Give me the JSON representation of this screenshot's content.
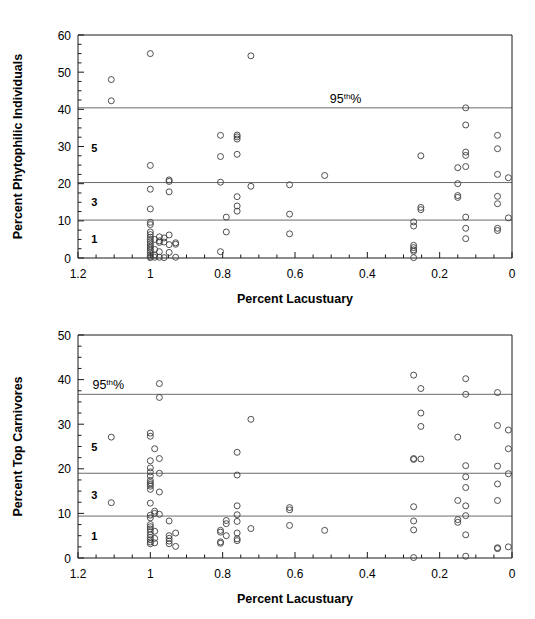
{
  "figure": {
    "background": "#ffffff",
    "marker_color": "#3d3d3d",
    "refline_color": "#6b6b6b",
    "axis_color": "#1a1a1a"
  },
  "charts": [
    {
      "id": "phytophilic",
      "title": "",
      "xlabel": "Percent Lacustuary",
      "ylabel": "Percent Phytophilic Individuals",
      "annotation": "95th%",
      "annotation_base": "95",
      "annotation_sup": "th",
      "annotation_tail": "%"
    },
    {
      "id": "carnivores",
      "title": "",
      "xlabel": "Percent Lacustuary",
      "ylabel": "Percent Top Carnivores",
      "annotation": "95th%",
      "annotation_base": "95",
      "annotation_sup": "th",
      "annotation_tail": "%"
    }
  ],
  "chart_data": [
    {
      "type": "scatter",
      "id": "phytophilic",
      "title": "",
      "xlabel": "Percent Lacustuary",
      "ylabel": "Percent Phytophilic Individuals",
      "xlim": [
        1.2,
        0.0
      ],
      "ylim": [
        0,
        60
      ],
      "x_reversed": true,
      "xticks": [
        1.2,
        1.0,
        0.8,
        0.6,
        0.4,
        0.2,
        0.0
      ],
      "xticklabels": [
        "1.2",
        "1",
        "0.8",
        "0.6",
        "0.4",
        "0.2",
        "0"
      ],
      "x_minor_step": 0.05,
      "yticks": [
        0,
        10,
        20,
        30,
        40,
        50,
        60
      ],
      "yticklabels": [
        "0",
        "10",
        "20",
        "30",
        "40",
        "50",
        "60"
      ],
      "y_minor_step": 2.5,
      "grid": false,
      "legend": "none",
      "reference_lines": [
        {
          "y": 40.4,
          "label": "95th%",
          "label_x": 0.46,
          "label_side": "right"
        },
        {
          "y": 20.3,
          "label": "",
          "label_x": null,
          "label_side": null
        },
        {
          "y": 10.2,
          "label": "",
          "label_x": null,
          "label_side": null
        }
      ],
      "zone_labels": [
        {
          "text": "5",
          "x": 1.155,
          "y": 29.5
        },
        {
          "text": "3",
          "x": 1.155,
          "y": 15.2
        },
        {
          "text": "1",
          "x": 1.155,
          "y": 5.0
        }
      ],
      "points": [
        [
          1.108,
          48.0
        ],
        [
          1.108,
          42.3
        ],
        [
          1.0,
          55.0
        ],
        [
          1.0,
          24.9
        ],
        [
          1.0,
          18.5
        ],
        [
          1.0,
          13.2
        ],
        [
          1.0,
          9.6
        ],
        [
          1.0,
          9.0
        ],
        [
          1.0,
          7.0
        ],
        [
          1.0,
          6.3
        ],
        [
          1.0,
          5.6
        ],
        [
          1.0,
          5.0
        ],
        [
          1.0,
          4.4
        ],
        [
          1.0,
          3.8
        ],
        [
          1.0,
          3.2
        ],
        [
          1.0,
          2.7
        ],
        [
          1.0,
          2.1
        ],
        [
          1.0,
          1.5
        ],
        [
          1.0,
          0.9
        ],
        [
          1.0,
          0.4
        ],
        [
          1.0,
          0.1
        ],
        [
          0.988,
          5.0
        ],
        [
          0.988,
          2.3
        ],
        [
          0.988,
          0.8
        ],
        [
          0.988,
          0.2
        ],
        [
          0.975,
          5.7
        ],
        [
          0.975,
          4.6
        ],
        [
          0.975,
          4.2
        ],
        [
          0.975,
          1.7
        ],
        [
          0.975,
          0.2
        ],
        [
          0.962,
          5.4
        ],
        [
          0.962,
          4.3
        ],
        [
          0.962,
          0.1
        ],
        [
          0.948,
          21.0
        ],
        [
          0.948,
          20.6
        ],
        [
          0.948,
          17.8
        ],
        [
          0.948,
          6.2
        ],
        [
          0.948,
          3.6
        ],
        [
          0.948,
          1.5
        ],
        [
          0.93,
          4.1
        ],
        [
          0.93,
          3.7
        ],
        [
          0.93,
          0.2
        ],
        [
          0.806,
          33.0
        ],
        [
          0.806,
          27.3
        ],
        [
          0.806,
          20.4
        ],
        [
          0.806,
          1.7
        ],
        [
          0.79,
          11.0
        ],
        [
          0.79,
          7.0
        ],
        [
          0.76,
          33.1
        ],
        [
          0.76,
          32.6
        ],
        [
          0.76,
          32.0
        ],
        [
          0.76,
          27.9
        ],
        [
          0.76,
          16.5
        ],
        [
          0.76,
          14.0
        ],
        [
          0.76,
          12.6
        ],
        [
          0.722,
          54.4
        ],
        [
          0.722,
          19.3
        ],
        [
          0.615,
          19.7
        ],
        [
          0.615,
          11.8
        ],
        [
          0.615,
          6.5
        ],
        [
          0.518,
          22.2
        ],
        [
          0.272,
          9.7
        ],
        [
          0.272,
          8.6
        ],
        [
          0.272,
          3.4
        ],
        [
          0.272,
          2.8
        ],
        [
          0.272,
          2.2
        ],
        [
          0.272,
          1.8
        ],
        [
          0.272,
          0.1
        ],
        [
          0.252,
          27.5
        ],
        [
          0.252,
          13.6
        ],
        [
          0.252,
          13.0
        ],
        [
          0.15,
          24.3
        ],
        [
          0.15,
          20.0
        ],
        [
          0.15,
          16.8
        ],
        [
          0.15,
          16.3
        ],
        [
          0.128,
          40.4
        ],
        [
          0.128,
          35.8
        ],
        [
          0.128,
          28.5
        ],
        [
          0.128,
          27.6
        ],
        [
          0.128,
          24.6
        ],
        [
          0.128,
          11.0
        ],
        [
          0.128,
          8.0
        ],
        [
          0.128,
          5.2
        ],
        [
          0.04,
          33.0
        ],
        [
          0.04,
          29.4
        ],
        [
          0.04,
          22.5
        ],
        [
          0.04,
          16.6
        ],
        [
          0.04,
          14.6
        ],
        [
          0.04,
          8.0
        ],
        [
          0.04,
          7.4
        ],
        [
          0.01,
          21.6
        ],
        [
          0.01,
          10.8
        ]
      ]
    },
    {
      "type": "scatter",
      "id": "carnivores",
      "title": "",
      "xlabel": "Percent Lacustuary",
      "ylabel": "Percent Top Carnivores",
      "xlim": [
        1.2,
        0.0
      ],
      "ylim": [
        0,
        50
      ],
      "x_reversed": true,
      "xticks": [
        1.2,
        1.0,
        0.8,
        0.6,
        0.4,
        0.2,
        0.0
      ],
      "xticklabels": [
        "1.2",
        "1",
        "0.8",
        "0.6",
        "0.4",
        "0.2",
        "0"
      ],
      "x_minor_step": 0.05,
      "yticks": [
        0,
        10,
        20,
        30,
        40,
        50
      ],
      "yticklabels": [
        "0",
        "10",
        "20",
        "30",
        "40",
        "50"
      ],
      "y_minor_step": 2.5,
      "grid": false,
      "legend": "none",
      "reference_lines": [
        {
          "y": 36.7,
          "label": "95th%",
          "label_x": 1.16,
          "label_side": "left"
        },
        {
          "y": 19.0,
          "label": "",
          "label_x": null,
          "label_side": null
        },
        {
          "y": 9.4,
          "label": "",
          "label_x": null,
          "label_side": null
        }
      ],
      "zone_labels": [
        {
          "text": "5",
          "x": 1.155,
          "y": 24.8
        },
        {
          "text": "3",
          "x": 1.155,
          "y": 14.2
        },
        {
          "text": "1",
          "x": 1.155,
          "y": 5.0
        }
      ],
      "points": [
        [
          1.108,
          27.1
        ],
        [
          1.108,
          12.4
        ],
        [
          1.0,
          28.0
        ],
        [
          1.0,
          27.3
        ],
        [
          1.0,
          21.8
        ],
        [
          1.0,
          20.2
        ],
        [
          1.0,
          19.3
        ],
        [
          1.0,
          18.4
        ],
        [
          1.0,
          17.4
        ],
        [
          1.0,
          16.9
        ],
        [
          1.0,
          16.5
        ],
        [
          1.0,
          16.1
        ],
        [
          1.0,
          15.4
        ],
        [
          1.0,
          12.3
        ],
        [
          1.0,
          9.6
        ],
        [
          1.0,
          9.0
        ],
        [
          1.0,
          7.5
        ],
        [
          1.0,
          7.0
        ],
        [
          1.0,
          6.5
        ],
        [
          1.0,
          5.9
        ],
        [
          1.0,
          5.2
        ],
        [
          1.0,
          4.6
        ],
        [
          1.0,
          4.1
        ],
        [
          1.0,
          3.6
        ],
        [
          1.0,
          3.2
        ],
        [
          0.988,
          24.5
        ],
        [
          0.988,
          10.5
        ],
        [
          0.988,
          10.0
        ],
        [
          0.988,
          6.0
        ],
        [
          0.988,
          4.4
        ],
        [
          0.988,
          3.4
        ],
        [
          0.975,
          39.1
        ],
        [
          0.975,
          36.0
        ],
        [
          0.975,
          22.3
        ],
        [
          0.975,
          19.0
        ],
        [
          0.975,
          14.8
        ],
        [
          0.975,
          9.8
        ],
        [
          0.948,
          8.3
        ],
        [
          0.948,
          5.0
        ],
        [
          0.948,
          4.4
        ],
        [
          0.948,
          3.8
        ],
        [
          0.948,
          3.2
        ],
        [
          0.93,
          5.6
        ],
        [
          0.93,
          2.6
        ],
        [
          0.806,
          6.2
        ],
        [
          0.806,
          5.8
        ],
        [
          0.806,
          3.6
        ],
        [
          0.806,
          3.3
        ],
        [
          0.79,
          8.4
        ],
        [
          0.79,
          7.7
        ],
        [
          0.79,
          5.0
        ],
        [
          0.76,
          23.7
        ],
        [
          0.76,
          18.6
        ],
        [
          0.76,
          11.7
        ],
        [
          0.76,
          9.7
        ],
        [
          0.76,
          8.2
        ],
        [
          0.76,
          5.6
        ],
        [
          0.76,
          4.3
        ],
        [
          0.76,
          3.9
        ],
        [
          0.722,
          31.1
        ],
        [
          0.722,
          6.6
        ],
        [
          0.615,
          11.3
        ],
        [
          0.615,
          10.8
        ],
        [
          0.615,
          7.3
        ],
        [
          0.518,
          6.2
        ],
        [
          0.272,
          41.0
        ],
        [
          0.272,
          22.3
        ],
        [
          0.272,
          22.1
        ],
        [
          0.272,
          11.5
        ],
        [
          0.272,
          8.3
        ],
        [
          0.272,
          6.3
        ],
        [
          0.272,
          0.1
        ],
        [
          0.252,
          38.0
        ],
        [
          0.252,
          32.5
        ],
        [
          0.252,
          29.5
        ],
        [
          0.252,
          22.2
        ],
        [
          0.15,
          27.1
        ],
        [
          0.15,
          12.9
        ],
        [
          0.15,
          8.6
        ],
        [
          0.15,
          8.0
        ],
        [
          0.128,
          40.2
        ],
        [
          0.128,
          36.7
        ],
        [
          0.128,
          20.7
        ],
        [
          0.128,
          18.2
        ],
        [
          0.128,
          15.8
        ],
        [
          0.128,
          11.7
        ],
        [
          0.128,
          9.5
        ],
        [
          0.128,
          5.2
        ],
        [
          0.128,
          0.4
        ],
        [
          0.04,
          37.1
        ],
        [
          0.04,
          29.7
        ],
        [
          0.04,
          20.6
        ],
        [
          0.04,
          16.6
        ],
        [
          0.04,
          12.9
        ],
        [
          0.04,
          2.3
        ],
        [
          0.04,
          2.1
        ],
        [
          0.01,
          28.7
        ],
        [
          0.01,
          24.5
        ],
        [
          0.01,
          18.9
        ],
        [
          0.01,
          2.5
        ]
      ]
    }
  ]
}
